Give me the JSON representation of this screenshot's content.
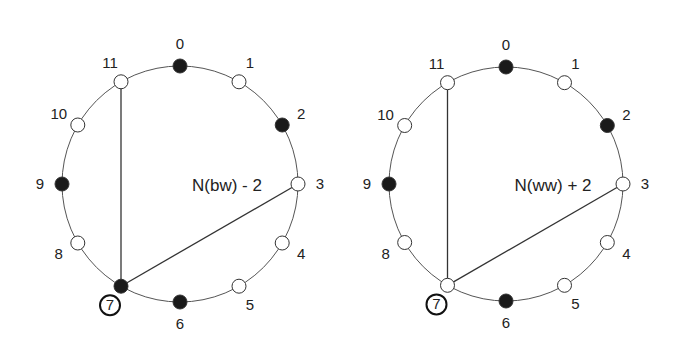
{
  "diagrams": [
    {
      "id": "left",
      "center_label": "N(bw) - 2",
      "cx": 180,
      "cy": 184,
      "r": 118,
      "highlighted_node": 7,
      "filled_nodes": [
        0,
        2,
        6,
        7,
        9
      ],
      "edges": [
        [
          11,
          7
        ],
        [
          3,
          7
        ]
      ]
    },
    {
      "id": "right",
      "center_label": "N(ww) + 2",
      "cx": 506,
      "cy": 184,
      "r": 117,
      "highlighted_node": 7,
      "filled_nodes": [
        0,
        2,
        6,
        9
      ],
      "edges": [
        [
          11,
          7
        ],
        [
          3,
          7
        ]
      ]
    }
  ],
  "node_labels": [
    "0",
    "1",
    "2",
    "3",
    "4",
    "5",
    "6",
    "7",
    "8",
    "9",
    "10",
    "11"
  ],
  "colors": {
    "stroke": "#444444",
    "filled": "#1a1a1a",
    "empty": "#ffffff",
    "text": "#222222"
  }
}
